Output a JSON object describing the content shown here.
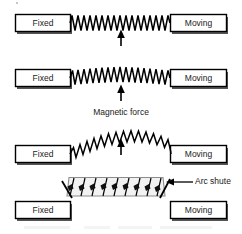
{
  "figure": {
    "title_visible": false,
    "background_color": "#ffffff",
    "stroke_color": "#000000",
    "text_color": "#1a1a1a",
    "chute_fill_color": "#f2f2f2",
    "chute_stroke_color": "#8c8c8c",
    "plate_fill_color": "#ffffff",
    "arc_blob_color": "#111111"
  },
  "stages": [
    {
      "id": "stage-1",
      "left_box_label": "Fixed",
      "right_box_label": "Moving",
      "arc_shape": "straight",
      "has_force_arrow": true
    },
    {
      "id": "stage-2",
      "left_box_label": "Fixed",
      "right_box_label": "Moving",
      "arc_shape": "slight-bow",
      "has_force_arrow": true
    },
    {
      "id": "stage-3",
      "left_box_label": "Fixed",
      "right_box_label": "Moving",
      "arc_shape": "high-arch",
      "has_force_arrow": true
    },
    {
      "id": "stage-4",
      "left_box_label": "Fixed",
      "right_box_label": "Moving",
      "arc_shape": "chute",
      "has_force_arrow": false
    }
  ],
  "annotations": {
    "magnetic_force_label": "Magnetic force",
    "arc_shute_label": "Arc shute"
  }
}
